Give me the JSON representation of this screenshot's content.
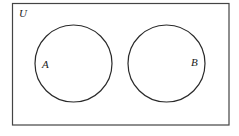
{
  "diagram": {
    "type": "venn",
    "universe": {
      "label": "U",
      "rect": {
        "x": 12.5,
        "y": 3.5,
        "width": 216.5,
        "height": 121.5
      }
    },
    "sets": [
      {
        "label": "A",
        "cx": 73.5,
        "cy": 63.5,
        "r": 38.5,
        "label_x": 42,
        "label_y": 68
      },
      {
        "label": "B",
        "cx": 166.5,
        "cy": 63.5,
        "r": 38.5,
        "label_x": 191,
        "label_y": 66
      }
    ],
    "relationship": "disjoint",
    "colors": {
      "stroke": "#2a2a2a",
      "background": "#ffffff"
    }
  }
}
